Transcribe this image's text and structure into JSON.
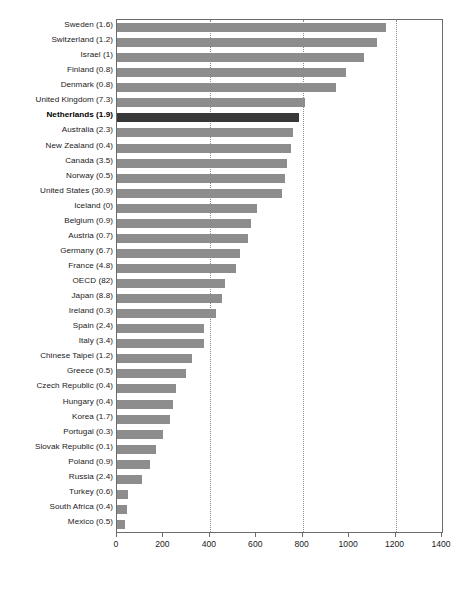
{
  "chart_data": {
    "type": "bar",
    "orientation": "horizontal",
    "title": "",
    "xlabel": "",
    "ylabel": "",
    "xlim": [
      0,
      1400
    ],
    "xticks": [
      0,
      200,
      400,
      600,
      800,
      1000,
      1200,
      1400
    ],
    "xtick_labels": [
      "0",
      "200",
      "400",
      "600",
      "800",
      "1000",
      "1200",
      "1400"
    ],
    "gridlines": [
      400,
      800,
      1200
    ],
    "grid": true,
    "legend": "none",
    "bar_color": "#8d8d8d",
    "highlight_color": "#383838",
    "highlight_category": "Netherlands (1.9)",
    "categories": [
      "Sweden (1.6)",
      "Switzerland (1.2)",
      "Israel (1)",
      "Finland (0.8)",
      "Denmark (0.8)",
      "United Kingdom (7.3)",
      "Netherlands (1.9)",
      "Australia (2.3)",
      "New Zealand (0.4)",
      "Canada (3.5)",
      "Norway (0.5)",
      "United States (30.9)",
      "Iceland (0)",
      "Belgium (0.9)",
      "Austria (0.7)",
      "Germany (6.7)",
      "France (4.8)",
      "OECD (82)",
      "Japan (8.8)",
      "Ireland (0.3)",
      "Spain (2.4)",
      "Italy (3.4)",
      "Chinese Taipei (1.2)",
      "Greece (0.5)",
      "Czech Republic (0.4)",
      "Hungary (0.4)",
      "Korea (1.7)",
      "Portugal (0.3)",
      "Slovak Republic (0.1)",
      "Poland (0.9)",
      "Russia (2.4)",
      "Turkey (0.6)",
      "South Africa (0.4)",
      "Mexico (0.5)"
    ],
    "values": [
      1160,
      1122,
      1064,
      987,
      944,
      809,
      786,
      757,
      748,
      731,
      722,
      710,
      605,
      577,
      564,
      528,
      514,
      466,
      454,
      427,
      376,
      374,
      323,
      298,
      252,
      241,
      227,
      198,
      169,
      140,
      109,
      49,
      44,
      33
    ]
  }
}
